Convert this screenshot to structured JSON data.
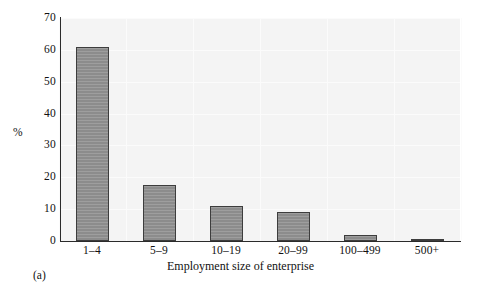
{
  "figure": {
    "panel_caption": "(a)",
    "background_color": "#ffffff",
    "plot_background_color": "#f4f4f4",
    "bar_fill_color": "#8c8c8c",
    "bar_edge_color": "#3d3d3d",
    "axis_color": "#2b2b2b"
  },
  "chart_data": {
    "type": "bar",
    "title": "",
    "subtitle": "",
    "xlabel": "Employment size of enterprise",
    "ylabel": "%",
    "categories": [
      "1–4",
      "5–9",
      "10–19",
      "20–99",
      "100–499",
      "500+"
    ],
    "values": [
      61,
      17.5,
      11,
      9,
      2,
      0.5
    ],
    "ylim": [
      0,
      70
    ],
    "yticks": [
      0,
      10,
      20,
      30,
      40,
      50,
      60,
      70
    ],
    "ytick_labels": [
      "0",
      "10",
      "20",
      "30",
      "40",
      "50",
      "60",
      "70"
    ],
    "grid": true,
    "legend": false,
    "legend_position": "none",
    "annotations": [
      "(a)"
    ]
  }
}
